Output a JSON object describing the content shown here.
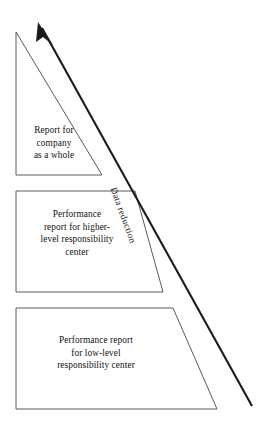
{
  "figure": {
    "background_color": "#ffffff",
    "outline_color": "#5a5a5a",
    "arrow_color": "#1a1a1a",
    "text_color": "#111111"
  },
  "arrow": {
    "label": "Data reduction",
    "direction": "upward-left",
    "tail": {
      "x": 252,
      "y": 406
    },
    "head": {
      "x": 38,
      "y": 22
    }
  },
  "levels": [
    {
      "id": "company-level",
      "shape": "right-triangle",
      "caption": "Report for\ncompany\nas a whole",
      "caption_lines": [
        "Report for",
        "company",
        "as a whole"
      ],
      "bounds": {
        "x": 16,
        "y": 32,
        "width": 86,
        "height": 143
      }
    },
    {
      "id": "higher-level",
      "shape": "trapezoid",
      "caption": "Performance\nreport for higher-\nlevel responsibility\ncenter",
      "caption_lines": [
        "Performance",
        "report for higher-",
        "level responsibility",
        "center"
      ],
      "bounds": {
        "x": 16,
        "y": 191,
        "width": 147,
        "height": 101
      }
    },
    {
      "id": "low-level",
      "shape": "trapezoid",
      "caption": "Performance report\nfor low-level\nresponsibility center",
      "caption_lines": [
        "Performance report",
        "for low-level",
        "responsibility center"
      ],
      "bounds": {
        "x": 16,
        "y": 308,
        "width": 201,
        "height": 101
      }
    }
  ]
}
